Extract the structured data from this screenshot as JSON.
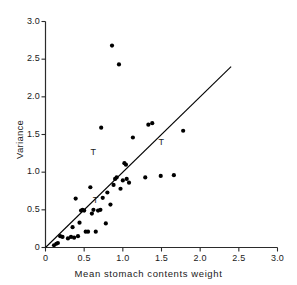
{
  "chart_data": {
    "type": "scatter",
    "title": "",
    "xlabel": "Mean stomach contents weight",
    "ylabel": "Variance",
    "xlim": [
      0,
      3.0
    ],
    "ylim": [
      0,
      3.0
    ],
    "grid": false,
    "legend": null,
    "xticks": [
      "0",
      "0.5",
      "1.0",
      "1.5",
      "2.0",
      "2.5",
      "3.0"
    ],
    "xtick_values": [
      0,
      0.5,
      1.0,
      1.5,
      2.0,
      2.5,
      3.0
    ],
    "yticks": [
      "0",
      "0.5",
      "1.0",
      "1.5",
      "2.0",
      "2.5",
      "3.0"
    ],
    "ytick_values": [
      0,
      0.5,
      1.0,
      1.5,
      2.0,
      2.5,
      3.0
    ],
    "series": [
      {
        "name": "observations",
        "marker": "filled-circle",
        "color": "#000000",
        "points": [
          [
            0.11,
            0.03
          ],
          [
            0.14,
            0.05
          ],
          [
            0.16,
            0.06
          ],
          [
            0.19,
            0.15
          ],
          [
            0.22,
            0.14
          ],
          [
            0.29,
            0.12
          ],
          [
            0.33,
            0.14
          ],
          [
            0.35,
            0.27
          ],
          [
            0.37,
            0.13
          ],
          [
            0.39,
            0.65
          ],
          [
            0.42,
            0.15
          ],
          [
            0.44,
            0.33
          ],
          [
            0.46,
            0.49
          ],
          [
            0.48,
            0.5
          ],
          [
            0.5,
            0.49
          ],
          [
            0.52,
            0.21
          ],
          [
            0.55,
            0.21
          ],
          [
            0.58,
            0.8
          ],
          [
            0.6,
            0.45
          ],
          [
            0.62,
            0.5
          ],
          [
            0.65,
            0.21
          ],
          [
            0.68,
            0.49
          ],
          [
            0.71,
            0.5
          ],
          [
            0.72,
            1.59
          ],
          [
            0.74,
            0.66
          ],
          [
            0.78,
            0.32
          ],
          [
            0.8,
            0.73
          ],
          [
            0.84,
            0.57
          ],
          [
            0.86,
            2.68
          ],
          [
            0.88,
            0.83
          ],
          [
            0.9,
            0.91
          ],
          [
            0.92,
            0.93
          ],
          [
            0.95,
            2.43
          ],
          [
            0.97,
            0.78
          ],
          [
            1.0,
            0.89
          ],
          [
            1.02,
            1.12
          ],
          [
            1.04,
            1.1
          ],
          [
            1.05,
            0.91
          ],
          [
            1.08,
            0.86
          ],
          [
            1.13,
            1.46
          ],
          [
            1.29,
            0.93
          ],
          [
            1.33,
            1.63
          ],
          [
            1.38,
            1.65
          ],
          [
            1.49,
            0.95
          ],
          [
            1.66,
            0.96
          ],
          [
            1.78,
            1.55
          ]
        ]
      }
    ],
    "annotations": [
      {
        "text": "T",
        "x": 0.62,
        "y": 1.26
      },
      {
        "text": "T",
        "x": 0.65,
        "y": 0.62
      },
      {
        "text": "T",
        "x": 1.5,
        "y": 1.39
      }
    ],
    "reference_line": {
      "name": "identity-line",
      "from": [
        0,
        0
      ],
      "to": [
        2.4,
        2.4
      ],
      "color": "#000000"
    }
  }
}
